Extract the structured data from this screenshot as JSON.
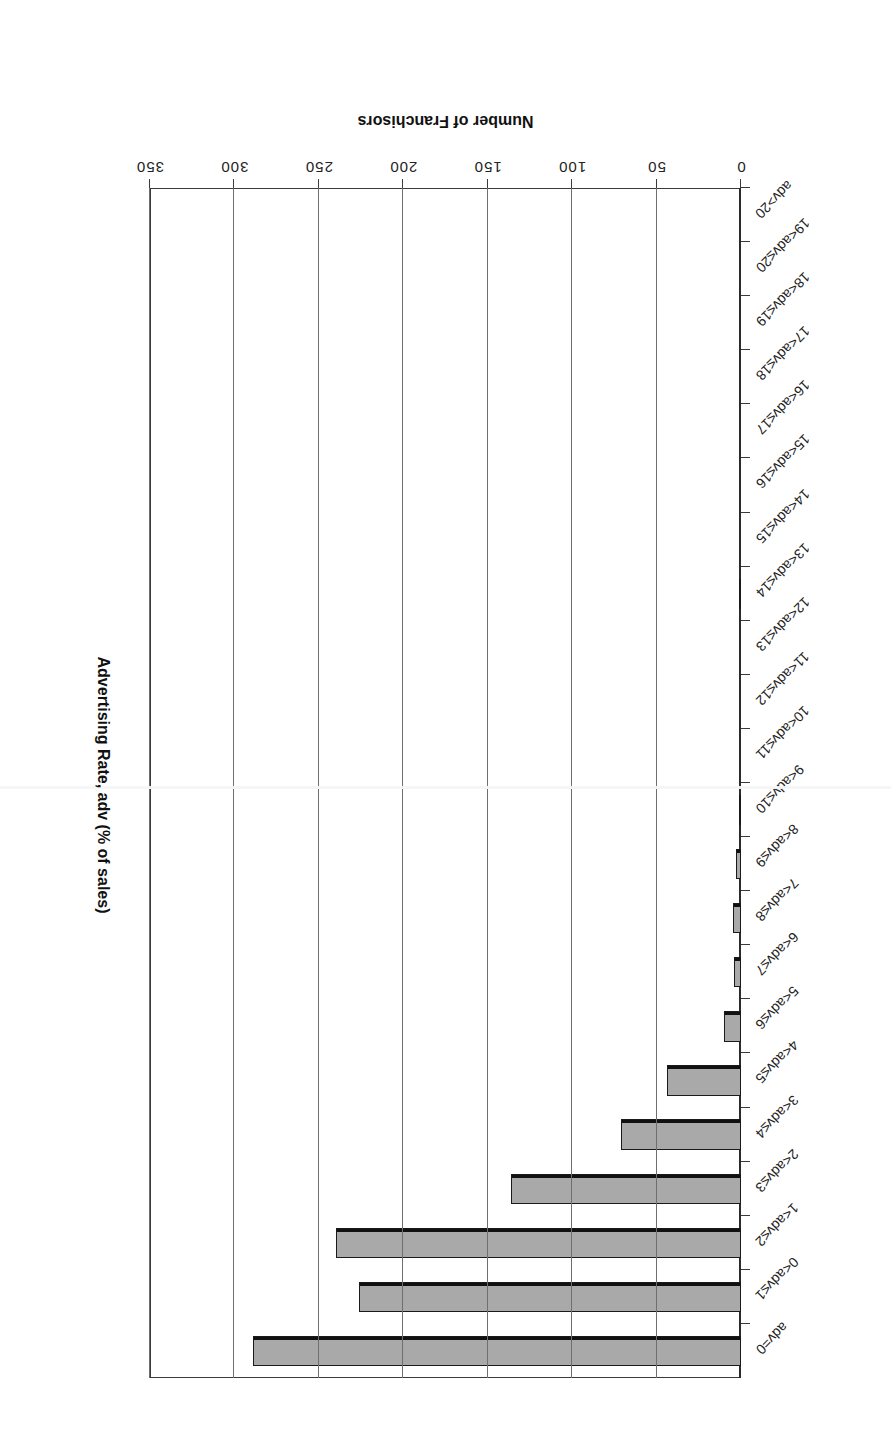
{
  "figure": {
    "value_axis_title": "Number of Franchisors",
    "category_axis_title": "Advertising Rate, adv (% of sales)",
    "orientation": "rotated-180"
  },
  "chart_data": {
    "type": "bar",
    "title": "",
    "xlabel": "Number of Franchisors",
    "ylabel": "Advertising Rate, adv (% of sales)",
    "orientation": "horizontal",
    "xlim": [
      0,
      350
    ],
    "xticks": [
      0,
      50,
      100,
      150,
      200,
      250,
      300,
      350
    ],
    "grid": "vertical",
    "legend": "none",
    "bar_fill": "#a9a9a9",
    "bar_edge": "#1a1a1a",
    "categories": [
      "adv=0",
      "0<adv≤1",
      "1<adv≤2",
      "2<adv≤3",
      "3<adv≤4",
      "4<adv≤5",
      "5<adv≤6",
      "6<adv≤7",
      "7<adv≤8",
      "8<adv≤9",
      "9<adv≤10",
      "10<adv≤11",
      "11<adv≤12",
      "12<adv≤13",
      "13<adv≤14",
      "14<adv≤15",
      "15<adv≤16",
      "16<adv≤17",
      "17<adv≤18",
      "18<adv≤19",
      "19<adv≤20",
      "adv>20"
    ],
    "values": [
      289,
      226,
      240,
      136,
      71,
      44,
      10,
      4,
      5,
      3,
      1,
      0,
      0,
      0,
      1,
      0,
      0,
      0,
      0,
      0,
      0,
      0
    ]
  }
}
